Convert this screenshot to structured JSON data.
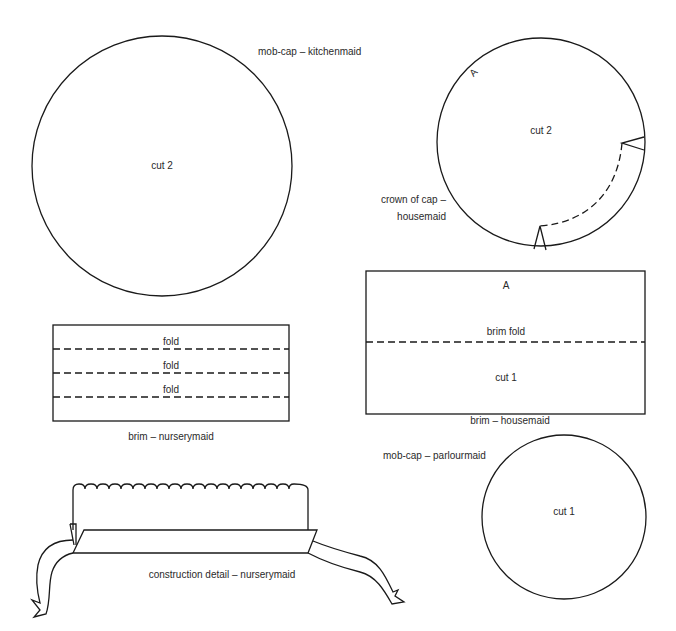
{
  "pieces": {
    "kitchenmaid_mobcap": {
      "title": "mob-cap – kitchenmaid",
      "cut": "cut 2"
    },
    "housemaid_crown": {
      "title_line1": "crown of cap –",
      "title_line2": "housemaid",
      "cut": "cut 2",
      "mark": "A"
    },
    "nurserymaid_brim": {
      "title": "brim – nurserymaid",
      "folds": [
        "fold",
        "fold",
        "fold"
      ]
    },
    "housemaid_brim": {
      "title": "brim – housemaid",
      "mark": "A",
      "fold": "brim fold",
      "cut": "cut 1"
    },
    "parlourmaid_mobcap": {
      "title": "mob-cap – parlourmaid",
      "cut": "cut 1"
    },
    "nurserymaid_construction": {
      "title": "construction detail – nurserymaid"
    }
  },
  "colors": {
    "line": "#1a1a1a",
    "text": "#2a2a2a",
    "background": "#ffffff"
  }
}
